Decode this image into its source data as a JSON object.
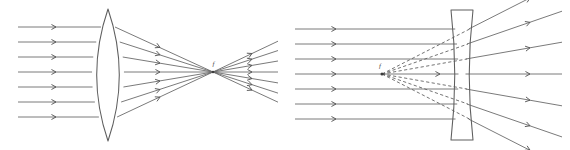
{
  "figure": {
    "background_color": "#ffffff",
    "width": 570,
    "height": 150,
    "ray_color": "#6b6b6b",
    "lens_color": "#5e5e5e",
    "label_color": "#4a4a4a"
  },
  "panels": [
    {
      "id": "converging-lens-panel",
      "name": "converging-lens-diagram",
      "lens_type": "biconvex",
      "lens_label": "converging lens",
      "behavior": "Parallel rays converge to a real focal point",
      "focal_label": "f",
      "focal_point": {
        "x": 213,
        "y": 72
      },
      "lens_center_x": 108,
      "lens_half_height": 66,
      "lens_bulge": 17,
      "incoming_ray_count": 7,
      "incoming_ray_y": [
        27,
        42,
        57,
        72,
        87,
        102,
        117
      ],
      "incoming_ray_start_x": 18,
      "incoming_arrow_x": 56,
      "refracted_arrow_x": 160,
      "outgoing_arrow_x": 252,
      "outgoing_end_x": 278,
      "outgoing_ray_spread": 1.0
    },
    {
      "id": "diverging-lens-panel",
      "name": "diverging-lens-diagram",
      "lens_type": "biconcave",
      "lens_label": "diverging lens",
      "behavior": "Parallel rays diverge; virtual rays trace back to a virtual focal point",
      "focal_label": "f",
      "focal_point": {
        "x": 382,
        "y": 74
      },
      "lens_center_x": 462,
      "lens_half_height": 65,
      "lens_waist": 9,
      "lens_edge_thickness": 22,
      "incoming_ray_count": 7,
      "incoming_ray_y": [
        29,
        44,
        59,
        74,
        89,
        104,
        119
      ],
      "incoming_ray_start_x": 295,
      "incoming_arrow_x": 336,
      "axis_arrow_x": 440,
      "outgoing_arrow_x": 530,
      "outgoing_end_x": 562,
      "virtual_ray_style": "dashed"
    }
  ],
  "labels": {
    "focal_point_left": "f",
    "focal_point_right": "f"
  }
}
